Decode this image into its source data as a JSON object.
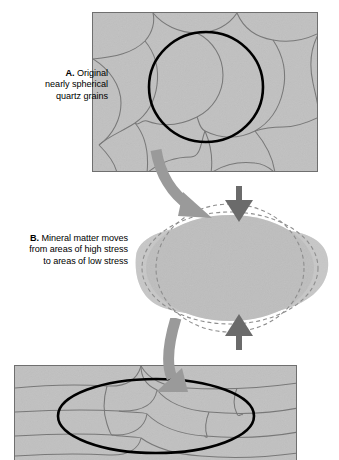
{
  "figure": {
    "type": "geology-diagram",
    "stages": [
      {
        "key": "a",
        "letter": "A.",
        "text": "Original nearly spherical quartz grains",
        "panel_label": "undeformed-sandstone-panel"
      },
      {
        "key": "b",
        "letter": "B.",
        "text": "Mineral matter moves from areas of high stress to areas of low stress",
        "panel_label": "single-grain-deformation"
      },
      {
        "key": "c",
        "letter": "",
        "text": "",
        "panel_label": "flattened-grains-panel"
      }
    ],
    "captions": {
      "a_letter": "A.",
      "a_line1": "Original",
      "a_line2": "nearly spherical",
      "a_line3": "quartz grains",
      "b_letter": "B.",
      "b_line1": "Mineral matter moves",
      "b_line2": "from areas of high stress",
      "b_line3": "to areas of low stress"
    },
    "annotations": {
      "highlight_circle": "bold black circle around one spherical grain",
      "highlight_ellipse": "bold black ellipse around one flattened grain",
      "dashed_outline_original": "dashed outline of original grain shape",
      "dashed_outline_deformed": "dashed outline of flattened grain shape",
      "stress_arrow_top": "downward compressive stress arrow",
      "stress_arrow_bottom": "upward compressive stress arrow",
      "flow_arrow_1": "curved arrow from stage A to stage B",
      "flow_arrow_2": "curved arrow from stage B to stage C"
    },
    "colors": {
      "rock_fill": "#c9c9c9",
      "grain_boundary": "#6f6f6f",
      "panel_border": "#6f6f6f",
      "highlight_outline": "#000000",
      "flow_arrow": "#9a9a9a",
      "stress_arrow": "#6b6b6b",
      "blob_light": "#cfcfcf",
      "blob_core": "#c6c6c6",
      "dashed_line": "#8e8e8e",
      "background": "#ffffff",
      "text": "#000000"
    }
  }
}
